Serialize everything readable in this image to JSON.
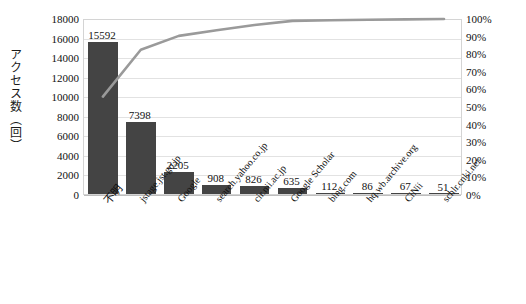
{
  "chart_data": {
    "type": "bar",
    "title": "",
    "subtitle": "",
    "xlabel": "",
    "ylabel": "アクセス数（回）",
    "y2label": "",
    "grid": true,
    "legend": "none",
    "ylim": [
      0,
      18000
    ],
    "y2lim": [
      0,
      100
    ],
    "yticks": [
      "18000",
      "16000",
      "14000",
      "12000",
      "10000",
      "8000",
      "6000",
      "4000",
      "2000",
      "0"
    ],
    "y2ticks": [
      "100%",
      "90%",
      "80%",
      "70%",
      "60%",
      "50%",
      "40%",
      "30%",
      "20%",
      "10%",
      "0%"
    ],
    "categories": [
      "不明",
      "jstage.jst.go.jp",
      "Google",
      "search.yahoo.co.jp",
      "cir.nii.ac.jp",
      "Google Scholar",
      "bing.com",
      "hq.wb.archive.org",
      "CiNii",
      "schlr.cnki.net"
    ],
    "series": [
      {
        "name": "アクセス数",
        "type": "bar",
        "values": [
          15592,
          7398,
          2205,
          908,
          826,
          635,
          112,
          86,
          67,
          51
        ],
        "labels": [
          "15592",
          "7398",
          "2205",
          "908",
          "826",
          "635",
          "112",
          "86",
          "67",
          "51"
        ],
        "color": "#444444",
        "axis": "left"
      },
      {
        "name": "累積比率",
        "type": "line",
        "values": [
          55.9,
          82.5,
          90.4,
          93.6,
          96.6,
          98.9,
          99.3,
          99.6,
          99.8,
          100.0
        ],
        "color": "#9a9a9a",
        "axis": "right"
      }
    ],
    "total": 27880
  }
}
